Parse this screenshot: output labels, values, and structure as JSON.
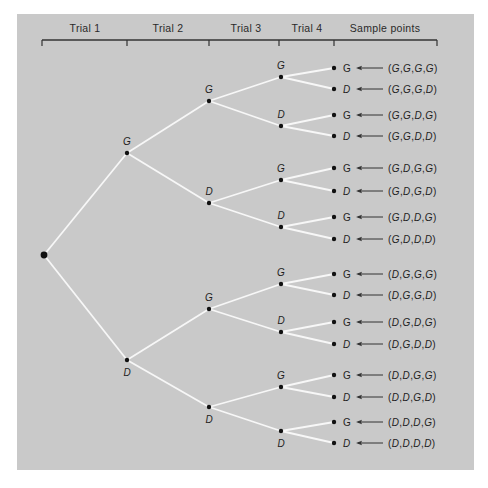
{
  "header": {
    "columns": [
      {
        "label": "Trial 1",
        "x": 85
      },
      {
        "label": "Trial 2",
        "x": 168
      },
      {
        "label": "Trial 3",
        "x": 246
      },
      {
        "label": "Trial 4",
        "x": 307
      },
      {
        "label": "Sample points",
        "x": 385
      }
    ],
    "ticks_x": [
      42,
      127,
      209,
      279,
      334,
      437
    ]
  },
  "colors": {
    "panel": "#c9c9c9",
    "branch": "#f7f7f7",
    "node": "#111111",
    "text": "#1e1e1e"
  },
  "tree": {
    "root": {
      "x": 44,
      "y": 255
    },
    "trial2": [
      {
        "label": "G",
        "x": 127,
        "y": 153,
        "label_pos": "above"
      },
      {
        "label": "D",
        "x": 127,
        "y": 360,
        "label_pos": "below"
      }
    ],
    "trial3": [
      {
        "label": "G",
        "x": 209,
        "y": 101,
        "parent": 0,
        "label_pos": "above"
      },
      {
        "label": "D",
        "x": 209,
        "y": 203,
        "parent": 0,
        "label_pos": "above"
      },
      {
        "label": "G",
        "x": 209,
        "y": 309,
        "parent": 1,
        "label_pos": "above"
      },
      {
        "label": "D",
        "x": 209,
        "y": 407,
        "parent": 1,
        "label_pos": "below"
      }
    ],
    "trial4": [
      {
        "label": "G",
        "x": 281,
        "y": 77,
        "parent": 0,
        "label_pos": "above"
      },
      {
        "label": "D",
        "x": 281,
        "y": 126,
        "parent": 0,
        "label_pos": "above"
      },
      {
        "label": "G",
        "x": 281,
        "y": 180,
        "parent": 1,
        "label_pos": "above"
      },
      {
        "label": "D",
        "x": 281,
        "y": 227,
        "parent": 1,
        "label_pos": "above"
      },
      {
        "label": "G",
        "x": 281,
        "y": 284,
        "parent": 2,
        "label_pos": "above"
      },
      {
        "label": "D",
        "x": 281,
        "y": 332,
        "parent": 2,
        "label_pos": "above"
      },
      {
        "label": "G",
        "x": 281,
        "y": 387,
        "parent": 3,
        "label_pos": "above"
      },
      {
        "label": "D",
        "x": 281,
        "y": 431,
        "parent": 3,
        "label_pos": "below"
      }
    ],
    "leaves": [
      {
        "label": "G",
        "y": 68,
        "parent": 0,
        "sample": "(G,G,G,G)"
      },
      {
        "label": "D",
        "y": 89,
        "parent": 0,
        "sample": "(G,G,G,D)"
      },
      {
        "label": "G",
        "y": 115,
        "parent": 1,
        "sample": "(G,G,D,G)"
      },
      {
        "label": "D",
        "y": 136,
        "parent": 1,
        "sample": "(G,G,D,D)"
      },
      {
        "label": "G",
        "y": 168,
        "parent": 2,
        "sample": "(G,D,G,G)"
      },
      {
        "label": "D",
        "y": 191,
        "parent": 2,
        "sample": "(G,D,G,D)"
      },
      {
        "label": "G",
        "y": 217,
        "parent": 3,
        "sample": "(G,D,D,G)"
      },
      {
        "label": "D",
        "y": 239,
        "parent": 3,
        "sample": "(G,D,D,D)"
      },
      {
        "label": "G",
        "y": 274,
        "parent": 4,
        "sample": "(D,G,G,G)"
      },
      {
        "label": "D",
        "y": 295,
        "parent": 4,
        "sample": "(D,G,G,D)"
      },
      {
        "label": "G",
        "y": 322,
        "parent": 5,
        "sample": "(D,G,D,G)"
      },
      {
        "label": "D",
        "y": 344,
        "parent": 5,
        "sample": "(D,G,D,D)"
      },
      {
        "label": "G",
        "y": 375,
        "parent": 6,
        "sample": "(D,D,G,G)"
      },
      {
        "label": "D",
        "y": 397,
        "parent": 6,
        "sample": "(D,D,G,D)"
      },
      {
        "label": "G",
        "y": 422,
        "parent": 7,
        "sample": "(D,D,D,G)"
      },
      {
        "label": "D",
        "y": 443,
        "parent": 7,
        "sample": "(D,D,D,D)"
      }
    ],
    "leaf_x": 334
  }
}
